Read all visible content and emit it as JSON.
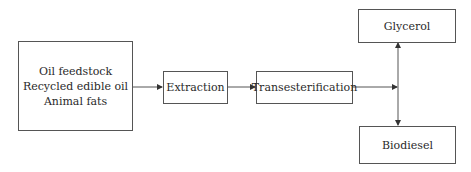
{
  "diagram": {
    "title": "",
    "nodes": [
      {
        "id": "feedstock",
        "lines": [
          "Oil feedstock",
          "Recycled edible oil",
          "Animal fats"
        ]
      },
      {
        "id": "extraction",
        "label": "Extraction"
      },
      {
        "id": "transesterification",
        "label": "Transesterification"
      },
      {
        "id": "glycerol",
        "label": "Glycerol"
      },
      {
        "id": "biodiesel",
        "label": "Biodiesel"
      }
    ],
    "edges": [
      {
        "from": "feedstock",
        "to": "extraction"
      },
      {
        "from": "extraction",
        "to": "transesterification"
      },
      {
        "from": "transesterification",
        "to": "glycerol"
      },
      {
        "from": "transesterification",
        "to": "biodiesel"
      }
    ],
    "colors": {
      "stroke": "#555555",
      "text": "#2a2a2a",
      "background": "#ffffff"
    }
  }
}
